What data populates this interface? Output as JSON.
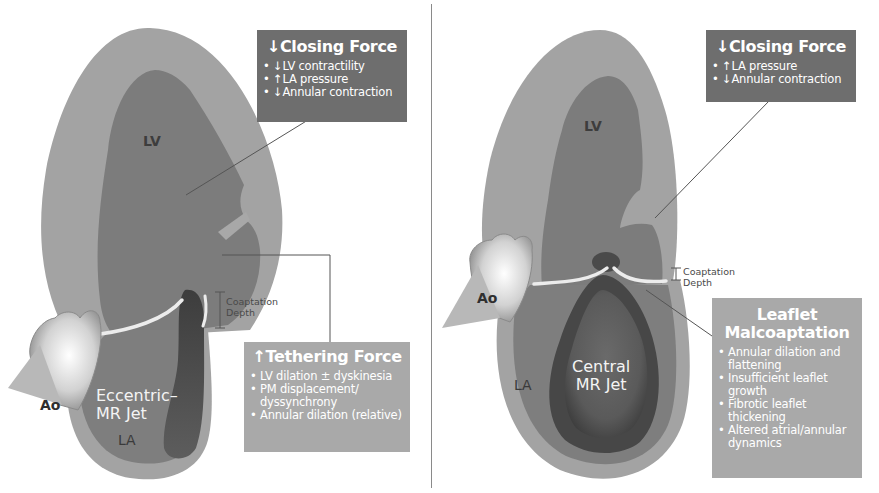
{
  "panels": [
    {
      "id": "left",
      "heart_labels": {
        "lv": "LV",
        "ao": "Ao",
        "la": "LA",
        "jet": "Eccentric–\nMR Jet",
        "jet_line1": "Eccentric–",
        "jet_line2": "MR Jet",
        "coaptation_line1": "Coaptation",
        "coaptation_line2": "Depth"
      },
      "closing_force": {
        "title": "↓Closing Force",
        "items": [
          "↓LV contractility",
          "↑LA pressure",
          "↓Annular contraction"
        ]
      },
      "tethering_force": {
        "title": "↑Tethering Force",
        "items": [
          "LV dilation ± dyskinesia",
          "PM displacement/ dyssynchrony",
          "Annular dilation (relative)"
        ]
      }
    },
    {
      "id": "right",
      "heart_labels": {
        "lv": "LV",
        "ao": "Ao",
        "la": "LA",
        "jet_line1": "Central",
        "jet_line2": "MR Jet",
        "coaptation_line1": "Coaptation",
        "coaptation_line2": "Depth"
      },
      "closing_force": {
        "title": "↓Closing Force",
        "items": [
          "↑LA pressure",
          "↓Annular contraction"
        ]
      },
      "leaflet_malcoaptation": {
        "title_line1": "Leaflet",
        "title_line2": "Malcoaptation",
        "items": [
          "Annular dilation and flattening",
          "Insufficient leaflet growth",
          "Fibrotic leaflet thickening",
          "Altered atrial/annular dynamics"
        ]
      }
    }
  ],
  "colors": {
    "myocardium": "#a3a3a3",
    "cavity": "#7c7c7c",
    "jet": "#555555",
    "dark_box": "#6e6e6e",
    "light_box": "#a9a9a9",
    "leaflet": "#e8e8e8",
    "divider": "#8a8a8a"
  }
}
